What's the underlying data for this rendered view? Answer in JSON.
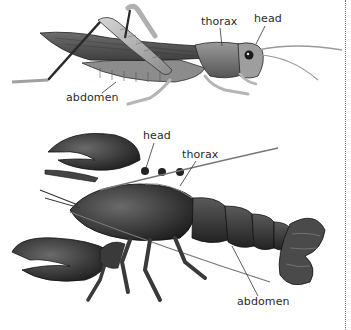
{
  "diagram": {
    "organisms": [
      {
        "name": "grasshopper",
        "labels": {
          "head": "head",
          "thorax": "thorax",
          "abdomen": "abdomen"
        }
      },
      {
        "name": "lobster",
        "labels": {
          "head": "head",
          "thorax": "thorax",
          "abdomen": "abdomen"
        }
      }
    ],
    "colors": {
      "background": "#ffffff",
      "ink": "#2a2a2a",
      "body_dark": "#3a3a3a",
      "body_mid": "#7a7a7a",
      "body_light": "#c8c8c8",
      "divider": "#777777"
    }
  }
}
